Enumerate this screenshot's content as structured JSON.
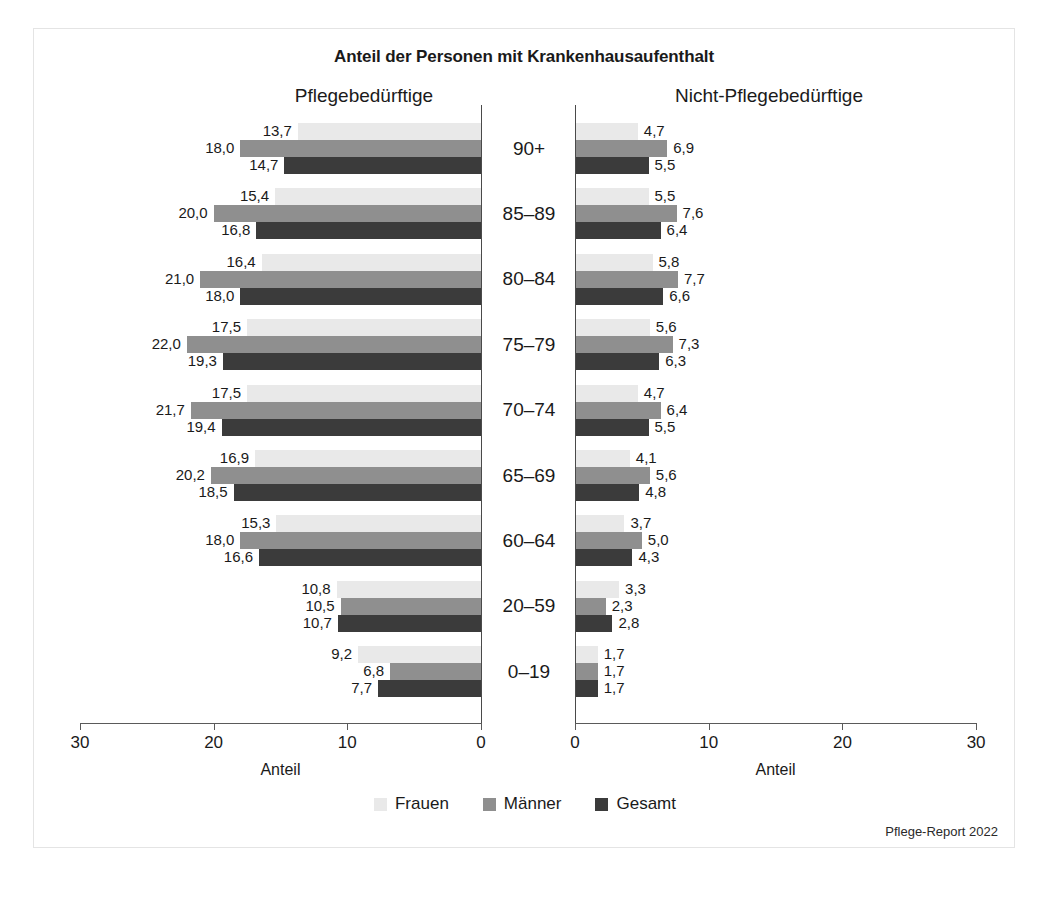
{
  "chart_data": {
    "type": "bar",
    "orientation": "horizontal",
    "layout": "back-to-back pyramid (two mirrored panels)",
    "title": "Anteil der Personen mit Krankenhausaufenthalt",
    "panels": [
      {
        "key": "pflegebeduerftige",
        "label": "Pflegebedürftige",
        "direction": "left",
        "xlabel": "Anteil",
        "ticks": [
          30,
          20,
          10,
          0
        ],
        "xlim": [
          0,
          30
        ]
      },
      {
        "key": "nicht_pflegebeduerftige",
        "label": "Nicht-Pflegebedürftige",
        "direction": "right",
        "xlabel": "Anteil",
        "ticks": [
          0,
          10,
          20,
          30
        ],
        "xlim": [
          0,
          30
        ]
      }
    ],
    "categories": [
      "90+",
      "85–89",
      "80–84",
      "75–79",
      "70–74",
      "65–69",
      "60–64",
      "20–59",
      "0–19"
    ],
    "legend": [
      {
        "name": "Frauen",
        "color": "#e9e9e9"
      },
      {
        "name": "Männer",
        "color": "#8f8f8f"
      },
      {
        "name": "Gesamt",
        "color": "#3b3b3b"
      }
    ],
    "legend_position": "bottom-center",
    "grid": false,
    "decimal_separator": ",",
    "series": [
      {
        "panel": "pflegebeduerftige",
        "name": "Frauen",
        "color": "#e9e9e9",
        "values": [
          13.7,
          15.4,
          16.4,
          17.5,
          17.5,
          16.9,
          15.3,
          10.8,
          9.2
        ],
        "labels": [
          "13,7",
          "15,4",
          "16,4",
          "17,5",
          "17,5",
          "16,9",
          "15,3",
          "10,8",
          "9,2"
        ]
      },
      {
        "panel": "pflegebeduerftige",
        "name": "Männer",
        "color": "#8f8f8f",
        "values": [
          18.0,
          20.0,
          21.0,
          22.0,
          21.7,
          20.2,
          18.0,
          10.5,
          6.8
        ],
        "labels": [
          "18,0",
          "20,0",
          "21,0",
          "22,0",
          "21,7",
          "20,2",
          "18,0",
          "10,5",
          "6,8"
        ]
      },
      {
        "panel": "pflegebeduerftige",
        "name": "Gesamt",
        "color": "#3b3b3b",
        "values": [
          14.7,
          16.8,
          18.0,
          19.3,
          19.4,
          18.5,
          16.6,
          10.7,
          7.7
        ],
        "labels": [
          "14,7",
          "16,8",
          "18,0",
          "19,3",
          "19,4",
          "18,5",
          "16,6",
          "10,7",
          "7,7"
        ]
      },
      {
        "panel": "nicht_pflegebeduerftige",
        "name": "Frauen",
        "color": "#e9e9e9",
        "values": [
          4.7,
          5.5,
          5.8,
          5.6,
          4.7,
          4.1,
          3.7,
          3.3,
          1.7
        ],
        "labels": [
          "4,7",
          "5,5",
          "5,8",
          "5,6",
          "4,7",
          "4,1",
          "3,7",
          "3,3",
          "1,7"
        ]
      },
      {
        "panel": "nicht_pflegebeduerftige",
        "name": "Männer",
        "color": "#8f8f8f",
        "values": [
          6.9,
          7.6,
          7.7,
          7.3,
          6.4,
          5.6,
          5.0,
          2.3,
          1.7
        ],
        "labels": [
          "6,9",
          "7,6",
          "7,7",
          "7,3",
          "6,4",
          "5,6",
          "5,0",
          "2,3",
          "1,7"
        ]
      },
      {
        "panel": "nicht_pflegebeduerftige",
        "name": "Gesamt",
        "color": "#3b3b3b",
        "values": [
          5.5,
          6.4,
          6.6,
          6.3,
          5.5,
          4.8,
          4.3,
          2.8,
          1.7
        ],
        "labels": [
          "5,5",
          "6,4",
          "6,6",
          "6,3",
          "5,5",
          "4,8",
          "4,3",
          "2,8",
          "1,7"
        ]
      }
    ]
  },
  "footer": {
    "source": "Pflege-Report 2022"
  }
}
